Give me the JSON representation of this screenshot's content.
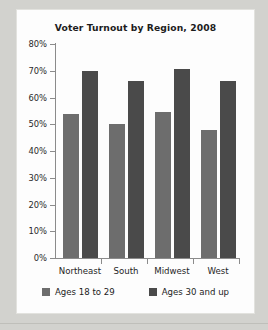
{
  "chart_data": {
    "type": "bar",
    "title": "Voter Turnout by Region, 2008",
    "xlabel": "",
    "ylabel": "",
    "categories": [
      "Northeast",
      "South",
      "Midwest",
      "West"
    ],
    "series": [
      {
        "name": "Ages 18 to 29",
        "color": "#6d6d6d",
        "values": [
          54,
          50,
          54.5,
          48
        ]
      },
      {
        "name": "Ages 30 and up",
        "color": "#4a4a4a",
        "values": [
          70,
          66,
          70.5,
          66
        ]
      }
    ],
    "ylim": [
      0,
      80
    ],
    "ytick_values": [
      0,
      10,
      20,
      30,
      40,
      50,
      60,
      70,
      80
    ],
    "ytick_labels": [
      "0%",
      "10%",
      "20%",
      "30%",
      "40%",
      "50%",
      "60%",
      "70%",
      "80%"
    ],
    "grid": false,
    "legend_position": "bottom"
  },
  "figure": {
    "panel_background": "#fdfdfd",
    "page_background": "#d2d2ce",
    "axis_color": "#8b8b8b"
  }
}
